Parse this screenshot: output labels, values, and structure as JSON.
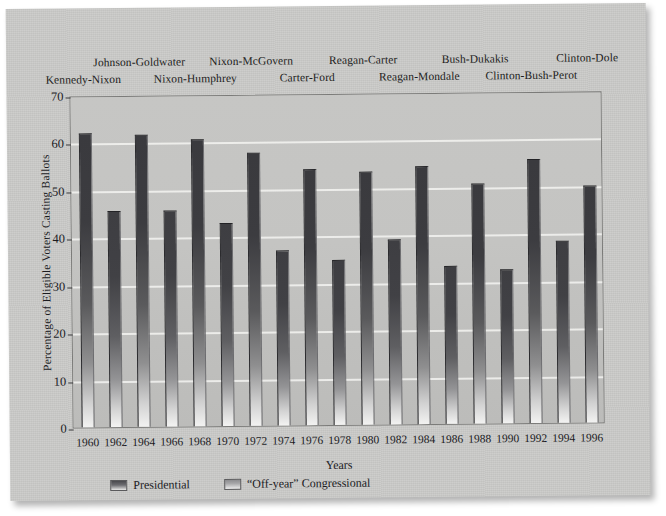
{
  "chart_data": {
    "type": "bar",
    "title": "",
    "xlabel": "Years",
    "ylabel": "Percentage of Eligible Voters Casting Ballots",
    "ylim": [
      0,
      70
    ],
    "yticks": [
      0,
      10,
      20,
      30,
      40,
      50,
      60,
      70
    ],
    "grid": true,
    "legend_position": "bottom-left",
    "categories": [
      "1960",
      "1962",
      "1964",
      "1966",
      "1968",
      "1970",
      "1972",
      "1974",
      "1976",
      "1978",
      "1980",
      "1982",
      "1984",
      "1986",
      "1988",
      "1990",
      "1992",
      "1994",
      "1996"
    ],
    "values": [
      62.0,
      45.5,
      61.5,
      45.5,
      60.5,
      42.7,
      57.5,
      37.0,
      54.0,
      34.8,
      53.4,
      39.0,
      54.3,
      33.3,
      50.6,
      32.5,
      55.7,
      38.4,
      49.9
    ],
    "series": [
      {
        "name": "Presidential",
        "points": [
          {
            "year": "1960",
            "value": 62.0
          },
          {
            "year": "1964",
            "value": 61.5
          },
          {
            "year": "1968",
            "value": 60.5
          },
          {
            "year": "1972",
            "value": 57.5
          },
          {
            "year": "1976",
            "value": 54.0
          },
          {
            "year": "1980",
            "value": 53.4
          },
          {
            "year": "1984",
            "value": 54.3
          },
          {
            "year": "1988",
            "value": 50.6
          },
          {
            "year": "1992",
            "value": 55.7
          },
          {
            "year": "1996",
            "value": 49.9
          }
        ]
      },
      {
        "name": "“Off-year” Congressional",
        "points": [
          {
            "year": "1962",
            "value": 45.5
          },
          {
            "year": "1966",
            "value": 45.5
          },
          {
            "year": "1970",
            "value": 42.7
          },
          {
            "year": "1974",
            "value": 37.0
          },
          {
            "year": "1978",
            "value": 34.8
          },
          {
            "year": "1982",
            "value": 39.0
          },
          {
            "year": "1986",
            "value": 33.3
          },
          {
            "year": "1990",
            "value": 32.5
          },
          {
            "year": "1994",
            "value": 38.4
          }
        ]
      }
    ],
    "annotations": [
      {
        "text": "Kennedy-Nixon",
        "row": "lower",
        "year": "1960"
      },
      {
        "text": "Johnson-Goldwater",
        "row": "upper",
        "year": "1964"
      },
      {
        "text": "Nixon-Humphrey",
        "row": "lower",
        "year": "1968"
      },
      {
        "text": "Nixon-McGovern",
        "row": "upper",
        "year": "1972"
      },
      {
        "text": "Carter-Ford",
        "row": "lower",
        "year": "1976"
      },
      {
        "text": "Reagan-Carter",
        "row": "upper",
        "year": "1980"
      },
      {
        "text": "Reagan-Mondale",
        "row": "lower",
        "year": "1984"
      },
      {
        "text": "Bush-Dukakis",
        "row": "upper",
        "year": "1988"
      },
      {
        "text": "Clinton-Bush-Perot",
        "row": "lower",
        "year": "1992"
      },
      {
        "text": "Clinton-Dole",
        "row": "upper",
        "year": "1996"
      }
    ]
  },
  "legend": {
    "items": [
      {
        "label": "Presidential",
        "kind": "presidential"
      },
      {
        "label": "“Off-year” Congressional",
        "kind": "offyear"
      }
    ]
  },
  "colors": {
    "page_background": "#c9c9c7",
    "plot_background": "#c3c3c1",
    "bar_presidential": "#3a3a3e",
    "bar_offyear": "#3e3e42",
    "gridline": "#f3f3f1",
    "text": "#1b1b1f",
    "frame": "#7b7b79"
  }
}
